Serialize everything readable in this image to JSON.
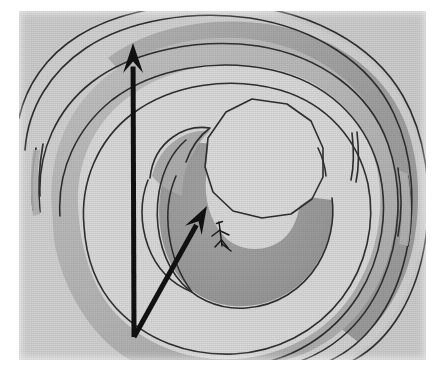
{
  "figure": {
    "media_type": "scanned grayscale line figure",
    "canvas": {
      "width": 437,
      "height": 367
    },
    "plate": {
      "x": 19,
      "y": 11,
      "width": 407,
      "height": 349
    },
    "colors": {
      "page_background": "#ffffff",
      "plate_background": "#d2d2d2",
      "tone_lightest": "#dcdcdc",
      "tone_light": "#d0d0d0",
      "tone_mid": "#b9b9b9",
      "tone_dark": "#9d9d9d",
      "tone_darkest": "#8c8c8c",
      "contour_line": "#2f2f2f",
      "arrow": "#111111",
      "marker": "#1a1a1a"
    },
    "layers": [
      {
        "name": "outer-contour-ring-1",
        "label": "outermost contour band",
        "tone": "#cfcfcf"
      },
      {
        "name": "outer-contour-ring-2",
        "label": "second contour band (dark upper-right limb)",
        "tone": "#a9a9a9"
      },
      {
        "name": "outer-contour-ring-3",
        "label": "third contour band",
        "tone": "#c6c6c6"
      },
      {
        "name": "inner-floor",
        "label": "broad light floor of the depression",
        "tone": "#d9d9d9"
      },
      {
        "name": "inner-crescent-shadow",
        "label": "dark crescent shadow inside the central pit",
        "tone": "#9b9b9b"
      },
      {
        "name": "central-polygon",
        "label": "central light polygonal plateau",
        "tone": "#dadada"
      }
    ],
    "arrows": [
      {
        "name": "vertical-arrow",
        "label": "long vertical direction arrow",
        "from": {
          "x": 134,
          "y": 337
        },
        "to": {
          "x": 133,
          "y": 43
        },
        "shaft_width": 5,
        "head_length": 30,
        "head_width": 20
      },
      {
        "name": "diagonal-arrow",
        "label": "diagonal direction arrow toward centre",
        "from": {
          "x": 134,
          "y": 337
        },
        "to": {
          "x": 207,
          "y": 206
        },
        "shaft_width": 5,
        "head_length": 28,
        "head_width": 19
      }
    ],
    "markers": [
      {
        "name": "scale-figure-marker",
        "label": "small stick-figure scale marker",
        "x": 221,
        "y": 233,
        "height": 26
      }
    ],
    "contour_paths": {
      "count": 7,
      "description": "nested irregular closed polylines forming concentric terraces"
    }
  }
}
